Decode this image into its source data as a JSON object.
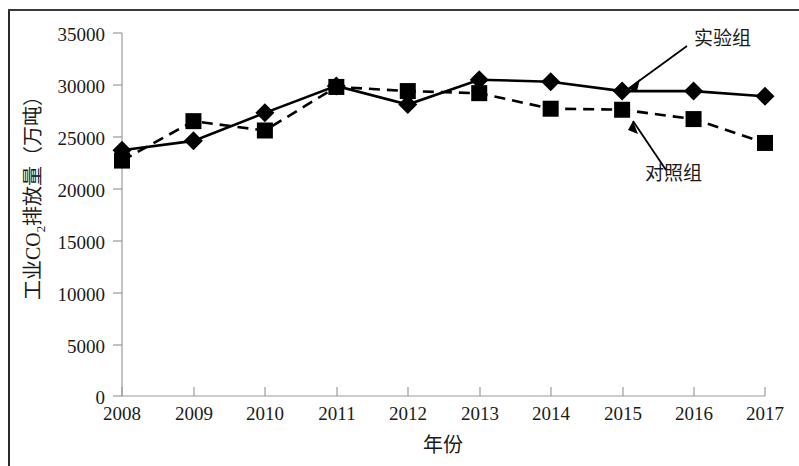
{
  "chart_data": {
    "type": "line",
    "title": "",
    "xlabel": "年份",
    "ylabel": "工业CO2排放量（万吨）",
    "ylabel_parts": {
      "pre": "工业CO",
      "sub": "2",
      "post": "排放量（万吨）"
    },
    "categories": [
      "2008",
      "2009",
      "2010",
      "2011",
      "2012",
      "2013",
      "2014",
      "2015",
      "2016",
      "2017"
    ],
    "x": [
      2008,
      2009,
      2010,
      2011,
      2012,
      2013,
      2014,
      2015,
      2016,
      2017
    ],
    "ylim": [
      0,
      35000
    ],
    "yticks": [
      0,
      5000,
      10000,
      15000,
      20000,
      25000,
      30000,
      35000
    ],
    "ytick_labels": [
      "0",
      "5000",
      "10000",
      "15000",
      "20000",
      "25000",
      "30000",
      "35000"
    ],
    "grid": false,
    "legend_position": "inline-annotations",
    "series": [
      {
        "name": "实验组",
        "marker": "diamond",
        "linestyle": "solid",
        "color": "#000000",
        "values": [
          23700,
          24600,
          27300,
          29900,
          28100,
          30500,
          30300,
          29400,
          29400,
          28900
        ]
      },
      {
        "name": "对照组",
        "marker": "square",
        "linestyle": "dashed",
        "color": "#000000",
        "values": [
          22700,
          26500,
          25600,
          29800,
          29400,
          29200,
          27700,
          27600,
          26700,
          24400
        ]
      }
    ],
    "annotations": [
      {
        "text": "实验组",
        "target_series": "实验组"
      },
      {
        "text": "对照组",
        "target_series": "对照组"
      }
    ]
  },
  "colors": {
    "ink": "#000000",
    "axis": "#9a9a9a",
    "frame": "#2a2a2a",
    "background": "#ffffff"
  }
}
